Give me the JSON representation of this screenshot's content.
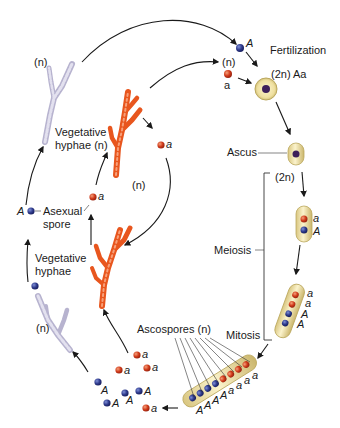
{
  "diagram": {
    "labels": {
      "fertilization": "Fertilization",
      "diploid_zygote": "(2n) Aa",
      "haploid_gametes": "(n)",
      "ascus": "Ascus",
      "ascus_ploidy": "(2n)",
      "meiosis": "Meiosis",
      "mitosis": "Mitosis",
      "ascospores": "Ascospores (n)",
      "vegetative_hyphae_top": "Vegetative",
      "vegetative_hyphae_top_line2": "hyphae (n)",
      "vegetative_hyphae_left": "Vegetative",
      "vegetative_hyphae_left_line2": "hyphae",
      "asexual_spore": "Asexual",
      "asexual_spore_line2": "spore",
      "haploid_inner": "(n)",
      "haploid_top_left": "(n)",
      "haploid_bottom_left": "(n)"
    },
    "alleles": {
      "dominant": "A",
      "recessive": "a"
    },
    "colors": {
      "allele_A": "#2e3a8c",
      "allele_a": "#d03a1a",
      "orange_hyphae": "#e8561e",
      "grey_hyphae": "#c9c6dc",
      "ascus_fill": "#efe4a8",
      "ascus_stroke": "#c9b870",
      "nucleus_diploid": "#3d1f5a"
    },
    "stages": [
      {
        "name": "Fertilization",
        "genotype": "Aa",
        "ploidy": "2n"
      },
      {
        "name": "Ascus",
        "ploidy": "2n"
      },
      {
        "name": "Meiosis",
        "products": [
          "a",
          "A"
        ]
      },
      {
        "name": "Meiosis II",
        "products": [
          "a",
          "a",
          "A",
          "A"
        ]
      },
      {
        "name": "Mitosis",
        "products": [
          "A",
          "A",
          "A",
          "A",
          "a",
          "a",
          "a",
          "a"
        ]
      },
      {
        "name": "Ascospores",
        "ploidy": "n"
      }
    ],
    "meiosis_ascus_labels": [
      "a",
      "A"
    ],
    "four_spore_labels": [
      "a",
      "a",
      "A",
      "A"
    ],
    "eight_spore_labels": [
      "A",
      "A",
      "A",
      "A",
      "a",
      "a",
      "a",
      "a"
    ],
    "released_spore_labels": [
      "a",
      "a",
      "a",
      "A",
      "A",
      "A",
      "A",
      "a"
    ]
  }
}
